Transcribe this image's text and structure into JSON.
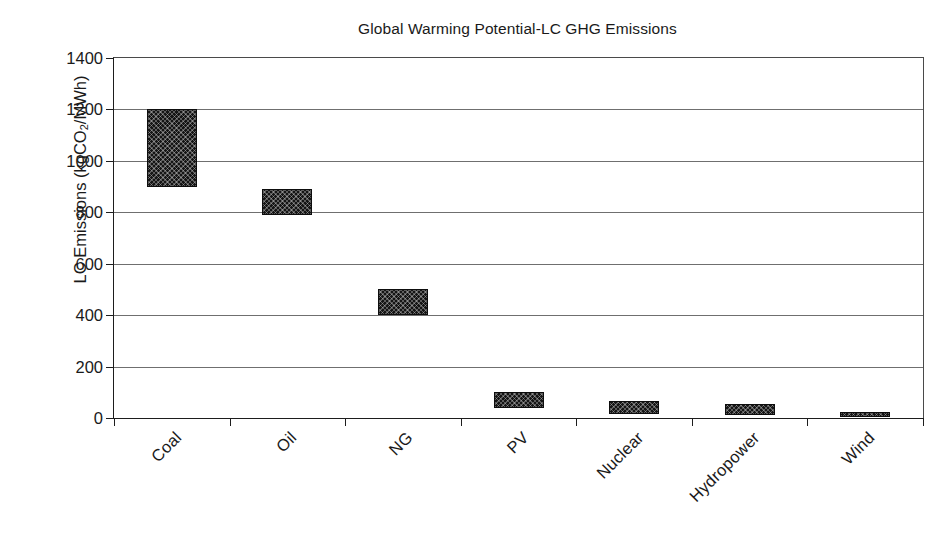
{
  "chart_data": {
    "type": "bar",
    "bar_style": "floating-range-bars",
    "title": "Global Warming Potential-LC GHG Emissions",
    "xlabel": "",
    "ylabel": "LC Emissions (kgCO2/MWh)",
    "ylabel_parts": {
      "pre": "LC Emissions (kgCO",
      "sub": "2",
      "post": "/MWh)"
    },
    "categories": [
      "Coal",
      "Oil",
      "NG",
      "PV",
      "Nuclear",
      "Hydropower",
      "Wind"
    ],
    "series": [
      {
        "name": "LC GHG Emissions range",
        "low": [
          900,
          790,
          400,
          40,
          15,
          10,
          5
        ],
        "high": [
          1200,
          890,
          500,
          100,
          65,
          55,
          25
        ]
      }
    ],
    "values_low": [
      900,
      790,
      400,
      40,
      15,
      10,
      5
    ],
    "values_high": [
      1200,
      890,
      500,
      100,
      65,
      55,
      25
    ],
    "ylim": [
      0,
      1400
    ],
    "y_ticks": [
      0,
      200,
      400,
      600,
      800,
      1000,
      1200,
      1400
    ],
    "y_tick_labels": [
      "0",
      "200",
      "400",
      "600",
      "800",
      "1000",
      "1200",
      "1400"
    ],
    "grid": "horizontal",
    "legend": "none",
    "legend_position": "none",
    "x_tick_label_rotation": -45,
    "colors": {
      "bar_fill": "#151515",
      "bar_edge": "#0d0d0d",
      "axis": "#1d1d1d",
      "gridline": "#6f6f6f",
      "background": "#ffffff",
      "text": "#1a1a1a"
    }
  }
}
